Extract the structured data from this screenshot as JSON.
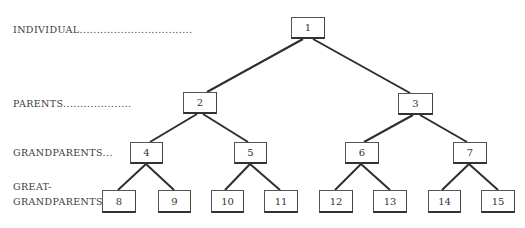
{
  "diagram": {
    "type": "binary-ancestry-tree",
    "generation_labels": [
      {
        "text": "INDIVIDUAL.................................",
        "level": 0
      },
      {
        "text": "PARENTS....................",
        "level": 1
      },
      {
        "text": "GRANDPARENTS...",
        "level": 2
      },
      {
        "text": "GREAT-",
        "level": 3
      },
      {
        "text": "GRANDPARENTS",
        "level": 3
      }
    ],
    "nodes": [
      {
        "id": "1",
        "label": "1",
        "x": 291,
        "y": 17,
        "w": 34,
        "h": 22
      },
      {
        "id": "2",
        "label": "2",
        "x": 183,
        "y": 92,
        "w": 34,
        "h": 22
      },
      {
        "id": "3",
        "label": "3",
        "x": 398,
        "y": 93,
        "w": 35,
        "h": 22
      },
      {
        "id": "4",
        "label": "4",
        "x": 130,
        "y": 142,
        "w": 33,
        "h": 22
      },
      {
        "id": "5",
        "label": "5",
        "x": 234,
        "y": 142,
        "w": 33,
        "h": 22
      },
      {
        "id": "6",
        "label": "6",
        "x": 345,
        "y": 142,
        "w": 34,
        "h": 22
      },
      {
        "id": "7",
        "label": "7",
        "x": 453,
        "y": 142,
        "w": 34,
        "h": 22
      },
      {
        "id": "8",
        "label": "8",
        "x": 102,
        "y": 190,
        "w": 34,
        "h": 23
      },
      {
        "id": "9",
        "label": "9",
        "x": 158,
        "y": 190,
        "w": 33,
        "h": 23
      },
      {
        "id": "10",
        "label": "10",
        "x": 211,
        "y": 190,
        "w": 33,
        "h": 23
      },
      {
        "id": "11",
        "label": "11",
        "x": 264,
        "y": 190,
        "w": 34,
        "h": 23
      },
      {
        "id": "12",
        "label": "12",
        "x": 319,
        "y": 190,
        "w": 34,
        "h": 23
      },
      {
        "id": "13",
        "label": "13",
        "x": 373,
        "y": 190,
        "w": 34,
        "h": 23
      },
      {
        "id": "14",
        "label": "14",
        "x": 428,
        "y": 190,
        "w": 33,
        "h": 23
      },
      {
        "id": "15",
        "label": "15",
        "x": 481,
        "y": 190,
        "w": 34,
        "h": 23
      }
    ],
    "edges": [
      [
        "1",
        "2"
      ],
      [
        "1",
        "3"
      ],
      [
        "2",
        "4"
      ],
      [
        "2",
        "5"
      ],
      [
        "3",
        "6"
      ],
      [
        "3",
        "7"
      ],
      [
        "4",
        "8"
      ],
      [
        "4",
        "9"
      ],
      [
        "5",
        "10"
      ],
      [
        "5",
        "11"
      ],
      [
        "6",
        "12"
      ],
      [
        "6",
        "13"
      ],
      [
        "7",
        "14"
      ],
      [
        "7",
        "15"
      ]
    ]
  }
}
